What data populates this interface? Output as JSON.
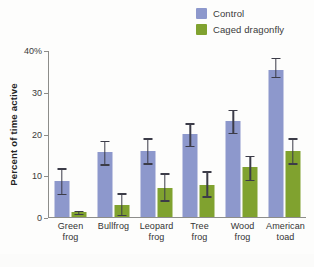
{
  "chart_data": {
    "type": "bar",
    "title": "",
    "xlabel": "",
    "ylabel": "Percent of time active",
    "ylim": [
      0,
      40
    ],
    "yticks": [
      0,
      10,
      20,
      30,
      40
    ],
    "ytick_labels": [
      "0",
      "10",
      "20",
      "30",
      "40%"
    ],
    "grid": false,
    "legend_position": "top-right",
    "categories": [
      "Green frog",
      "Bullfrog",
      "Leopard frog",
      "Tree frog",
      "Wood frog",
      "American toad"
    ],
    "category_lines": [
      [
        "Green",
        "frog"
      ],
      [
        "Bullfrog",
        ""
      ],
      [
        "Leopard",
        "frog"
      ],
      [
        "Tree",
        "frog"
      ],
      [
        "Wood",
        "frog"
      ],
      [
        "American",
        "toad"
      ]
    ],
    "series": [
      {
        "name": "Control",
        "color": "#8d98cc",
        "values": [
          8.5,
          15.5,
          15.7,
          19.8,
          22.8,
          35.0
        ],
        "error_low": [
          5.5,
          12.5,
          12.7,
          17.0,
          20.0,
          33.5
        ],
        "error_high": [
          11.5,
          18.2,
          18.7,
          22.3,
          25.5,
          38.0
        ]
      },
      {
        "name": "Caged dragonfly",
        "color": "#80a22f",
        "values": [
          1.0,
          2.7,
          6.9,
          7.6,
          11.9,
          15.8
        ],
        "error_low": [
          0.6,
          0.4,
          3.9,
          4.8,
          8.8,
          12.7
        ],
        "error_high": [
          1.4,
          5.6,
          10.3,
          10.8,
          14.5,
          18.7
        ]
      }
    ]
  },
  "legend": {
    "items": [
      {
        "label": "Control",
        "color": "#8d98cc"
      },
      {
        "label": "Caged dragonfly",
        "color": "#80a22f"
      }
    ]
  },
  "axes": {
    "y_title": "Percent of time active",
    "y_tick_0": "0",
    "y_tick_10": "10",
    "y_tick_20": "20",
    "y_tick_30": "30",
    "y_tick_40": "40%"
  }
}
